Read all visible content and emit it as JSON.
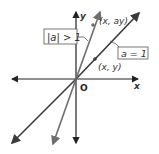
{
  "diagram": {
    "axes": {
      "x_label": "x",
      "y_label": "y",
      "origin_label": "O"
    },
    "lines": [
      {
        "name": "identity-line",
        "label": "a = 1",
        "color": "#3a3a3a"
      },
      {
        "name": "stretched-line",
        "label": "|a| > 1",
        "color": "#6e6e6e"
      }
    ],
    "points": [
      {
        "label": "(x, y)"
      },
      {
        "label": "(x, ay)"
      }
    ],
    "colors": {
      "axis": "#222222",
      "label_box_border": "#555555",
      "leader": "#555555"
    }
  }
}
